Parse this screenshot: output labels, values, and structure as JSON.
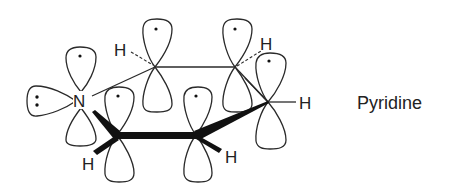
{
  "diagram": {
    "title": "Pyridine",
    "molecule_label": "Pyridine",
    "atoms": {
      "nitrogen": "N",
      "hydrogen": "H"
    },
    "hydrogen_labels": [
      "H",
      "H",
      "H",
      "H",
      "H"
    ],
    "lone_pair_symbol": "lone-pair-dots",
    "colors": {
      "line": "#2a2a2a",
      "background": "#ffffff",
      "text": "#222222"
    }
  }
}
